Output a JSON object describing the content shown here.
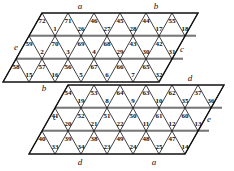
{
  "figure": {
    "triangle_count": 72,
    "colors": {
      "ink": "#111111",
      "paper": "#ffffff",
      "band": "#b9b9b9"
    },
    "top_parallelogram": {
      "name": "upper-parallelogram",
      "rows": [
        {
          "row": 1,
          "up": [
            "1",
            "26",
            "27",
            "28",
            "17",
            "18"
          ],
          "down": [
            "72",
            "71",
            "46",
            "45",
            "44",
            "55"
          ]
        },
        {
          "row": 2,
          "up": [
            "2",
            "3",
            "4",
            "29",
            "30",
            "31"
          ],
          "down": [
            "59",
            "70",
            "69",
            "68",
            "43",
            "42"
          ]
        },
        {
          "row": 3,
          "up": [
            "15",
            "16",
            "5",
            "6",
            "7",
            "32"
          ],
          "down": [
            "58",
            "57",
            "56",
            "67",
            "66",
            "65"
          ]
        }
      ],
      "edge_labels": {
        "top_left": "a",
        "top_right": "b",
        "left": "e",
        "right": "c",
        "bottom_left": "b"
      }
    },
    "bottom_parallelogram": {
      "name": "lower-parallelogram",
      "rows": [
        {
          "row": 4,
          "up": [
            "19",
            "8",
            "9",
            "10",
            "35",
            "36"
          ],
          "down": [
            "54",
            "53",
            "64",
            "63",
            "62",
            "37"
          ]
        },
        {
          "row": 5,
          "up": [
            "20",
            "21",
            "22",
            "11",
            "12",
            "13"
          ],
          "down": [
            "41",
            "52",
            "51",
            "50",
            "61",
            "60"
          ]
        },
        {
          "row": 6,
          "up": [
            "33",
            "34",
            "23",
            "24",
            "25",
            "14"
          ],
          "down": [
            "40",
            "39",
            "38",
            "49",
            "48",
            "47"
          ]
        }
      ],
      "edge_labels": {
        "top_right": "d",
        "left": "c",
        "right": "e",
        "bottom_left": "d",
        "bottom_right": "a"
      }
    },
    "labels": {
      "a_top": "a",
      "b_top": "b",
      "e_left": "e",
      "c_right": "c",
      "b_bottom": "b",
      "d_topright": "d",
      "c_left": "c",
      "e_right": "e",
      "d_bottom": "d",
      "a_bottom": "a"
    }
  }
}
